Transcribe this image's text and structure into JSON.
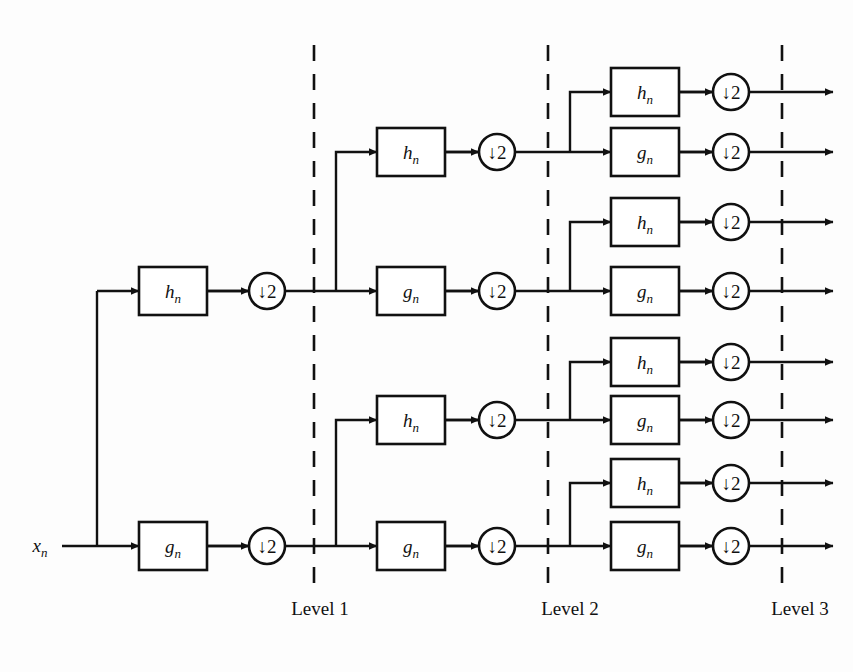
{
  "figure": {
    "background_color": "#fdfdfd",
    "ink_color": "#111111",
    "width": 853,
    "height": 672
  },
  "input": {
    "label": "x",
    "subscript": "n",
    "x": 40,
    "y": 546,
    "split_x": 97
  },
  "glyphs": {
    "lowpass": "h",
    "highpass": "g",
    "subscript": "n",
    "downsample_arrow": "↓",
    "downsample_factor": "2"
  },
  "level_labels": [
    {
      "text": "Level 1",
      "x": 320,
      "y": 615
    },
    {
      "text": "Level 2",
      "x": 570,
      "y": 615
    },
    {
      "text": "Level 3",
      "x": 800,
      "y": 615
    }
  ],
  "dividers": [
    {
      "name": "level-1-divider",
      "x": 314,
      "y1": 45,
      "y2": 588
    },
    {
      "name": "level-2-divider",
      "x": 548,
      "y1": 45,
      "y2": 588
    },
    {
      "name": "level-3-divider",
      "x": 782,
      "y1": 45,
      "y2": 588
    }
  ],
  "geometry": {
    "box_w": 68,
    "box_h": 48,
    "circle_r": 18,
    "stage1": {
      "box_x": 139,
      "circle_cx": 267,
      "out_x": 314
    },
    "stage2": {
      "branch_x": 336,
      "box_x": 377,
      "circle_cx": 497,
      "out_x": 548
    },
    "stage3": {
      "branch_x": 570,
      "box_x": 611,
      "circle_cx": 731,
      "out_x": 782,
      "arrow_end": 833
    }
  },
  "stages": [
    {
      "name": "level-1",
      "nodes": [
        {
          "id": "L1-h",
          "filter": "h",
          "y": 291
        },
        {
          "id": "L1-g",
          "filter": "g",
          "y": 546
        }
      ]
    },
    {
      "name": "level-2",
      "nodes": [
        {
          "id": "L2-hh",
          "filter": "h",
          "y": 152,
          "parent_y": 291
        },
        {
          "id": "L2-hg",
          "filter": "g",
          "y": 291,
          "parent_y": 291
        },
        {
          "id": "L2-gh",
          "filter": "h",
          "y": 420,
          "parent_y": 546
        },
        {
          "id": "L2-gg",
          "filter": "g",
          "y": 546,
          "parent_y": 546
        }
      ]
    },
    {
      "name": "level-3",
      "nodes": [
        {
          "id": "L3-hhh",
          "filter": "h",
          "y": 92,
          "parent_y": 152
        },
        {
          "id": "L3-hhg",
          "filter": "g",
          "y": 152,
          "parent_y": 152
        },
        {
          "id": "L3-hgh",
          "filter": "h",
          "y": 222,
          "parent_y": 291
        },
        {
          "id": "L3-hgg",
          "filter": "g",
          "y": 291,
          "parent_y": 291
        },
        {
          "id": "L3-ghh",
          "filter": "h",
          "y": 362,
          "parent_y": 420
        },
        {
          "id": "L3-ghg",
          "filter": "g",
          "y": 420,
          "parent_y": 420
        },
        {
          "id": "L3-ggh",
          "filter": "h",
          "y": 483,
          "parent_y": 546
        },
        {
          "id": "L3-ggg",
          "filter": "g",
          "y": 546,
          "parent_y": 546
        }
      ]
    }
  ]
}
